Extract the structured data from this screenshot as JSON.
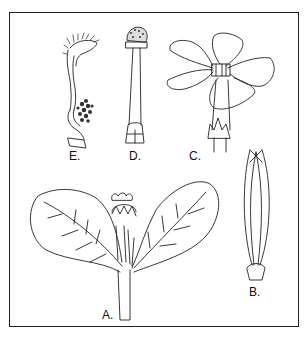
{
  "figure": {
    "type": "botanical-illustration",
    "panels": [
      {
        "id": "A",
        "label": "A.",
        "depicts": "flowering shoot with two ovate leaves and terminal flower bud"
      },
      {
        "id": "B",
        "label": "B.",
        "depicts": "dehisced fruit capsule with two slender valves"
      },
      {
        "id": "C",
        "label": "C.",
        "depicts": "open flower with five spreading petals and calyx"
      },
      {
        "id": "D",
        "label": "D.",
        "depicts": "pistil with capitate stigma, long style and ovary"
      },
      {
        "id": "E",
        "label": "E.",
        "depicts": "stamen/anther with hairy appendages"
      }
    ]
  },
  "colors": {
    "ink": "#222222",
    "background": "#ffffff"
  }
}
